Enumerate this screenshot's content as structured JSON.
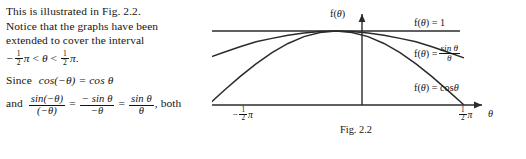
{
  "document": {
    "body_text": {
      "line1": "This is illustrated in Fig. 2.2.",
      "line2": "Notice that the graphs have been",
      "line3": "extended to cover the interval",
      "line4_prefix": "−",
      "line4_pi1": "π",
      "line4_rel1": "<",
      "line4_theta": "θ",
      "line4_rel2": "<",
      "line4_pi2": "π",
      "line4_period": ".",
      "line5_since": "Since",
      "line5_expr": "cos(−θ) = cos θ",
      "line6_and": "and",
      "line6_f1_num": "sin(−θ)",
      "line6_f1_den": "(−θ)",
      "line6_eq1": "=",
      "line6_f2_num": "− sin θ",
      "line6_f2_den": "−θ",
      "line6_eq2": "=",
      "line6_f3_num": "sin θ",
      "line6_f3_den": "θ",
      "line6_suffix": ", both"
    },
    "fraction_half": {
      "numerator": "1",
      "denominator": "2"
    }
  },
  "chart_data": {
    "type": "line",
    "title": "",
    "caption": "Fig. 2.2",
    "xlabel": "θ",
    "ylabel": "f(θ)",
    "xlim": [
      -1.5707963,
      1.5707963
    ],
    "ylim": [
      0,
      1.08
    ],
    "grid": false,
    "legend_position": "right-inline",
    "x_tick_labels": [
      "−½π",
      "½π"
    ],
    "x_tick_values": [
      -1.5707963,
      1.5707963
    ],
    "series": [
      {
        "name": "f(θ) = 1",
        "label_text": "f(θ) = 1",
        "color": "#2b2b2b",
        "x": [
          -1.5707963,
          -1.178,
          -0.785,
          -0.393,
          0,
          0.393,
          0.785,
          1.178,
          1.5707963
        ],
        "values": [
          1,
          1,
          1,
          1,
          1,
          1,
          1,
          1,
          1
        ]
      },
      {
        "name": "f(θ) = sinθ/θ",
        "label_numerator": "sin θ",
        "label_denominator": "θ",
        "label_prefix": "f(θ) =",
        "color": "#2b2b2b",
        "x": [
          -1.5707963,
          -1.3744,
          -1.178,
          -0.9817,
          -0.7854,
          -0.589,
          -0.3927,
          -0.1963,
          0,
          0.1963,
          0.3927,
          0.589,
          0.7854,
          0.9817,
          1.178,
          1.3744,
          1.5707963
        ],
        "values": [
          0.6366,
          0.7134,
          0.7871,
          0.854,
          0.9003,
          0.944,
          0.9745,
          0.9936,
          1.0,
          0.9936,
          0.9745,
          0.944,
          0.9003,
          0.854,
          0.7871,
          0.7134,
          0.6366
        ]
      },
      {
        "name": "f(θ) = cosθ",
        "label_text": "f(θ) = cosθ",
        "color": "#2b2b2b",
        "x": [
          -1.5707963,
          -1.3744,
          -1.178,
          -0.9817,
          -0.7854,
          -0.589,
          -0.3927,
          -0.1963,
          0,
          0.1963,
          0.3927,
          0.589,
          0.7854,
          0.9817,
          1.178,
          1.3744,
          1.5707963
        ],
        "values": [
          0.0,
          0.1951,
          0.3827,
          0.5556,
          0.7071,
          0.8315,
          0.9239,
          0.9808,
          1.0,
          0.9808,
          0.9239,
          0.8315,
          0.7071,
          0.5556,
          0.3827,
          0.1951,
          0.0
        ]
      }
    ]
  }
}
